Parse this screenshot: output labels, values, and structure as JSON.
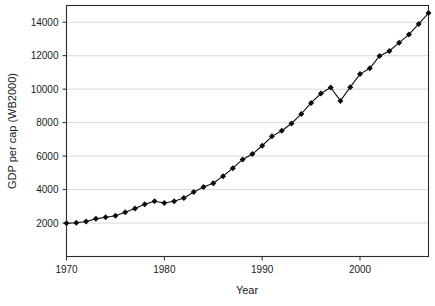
{
  "chart_data": {
    "type": "line",
    "title": "",
    "xlabel": "Year",
    "ylabel": "GDP per cap (WB2000)",
    "xlim": [
      1970,
      2007
    ],
    "ylim": [
      0,
      15000
    ],
    "xticks": [
      1970,
      1980,
      1990,
      2000
    ],
    "xtick_labels": [
      "1970",
      "1980",
      "1990",
      "2000"
    ],
    "yticks": [
      2000,
      4000,
      6000,
      8000,
      10000,
      12000,
      14000
    ],
    "ytick_labels": [
      "2000",
      "4000",
      "6000",
      "8000",
      "10000",
      "12000",
      "14000"
    ],
    "grid": "horizontal",
    "legend": "none",
    "marker": "filled-diamond",
    "x": [
      1970,
      1971,
      1972,
      1973,
      1974,
      1975,
      1976,
      1977,
      1978,
      1979,
      1980,
      1981,
      1982,
      1983,
      1984,
      1985,
      1986,
      1987,
      1988,
      1989,
      1990,
      1991,
      1992,
      1993,
      1994,
      1995,
      1996,
      1997,
      1998,
      1999,
      2000,
      2001,
      2002,
      2003,
      2004,
      2005,
      2006,
      2007
    ],
    "values": [
      1980,
      2020,
      2090,
      2250,
      2350,
      2440,
      2650,
      2870,
      3120,
      3300,
      3200,
      3300,
      3500,
      3850,
      4150,
      4380,
      4800,
      5280,
      5800,
      6120,
      6620,
      7180,
      7520,
      7950,
      8520,
      9180,
      9740,
      10100,
      9300,
      10120,
      10900,
      11250,
      11980,
      12280,
      12780,
      13260,
      13900,
      14550
    ],
    "series_name": "GDP per cap"
  },
  "axes": {
    "x_axis_title": "Year",
    "y_axis_title": "GDP per cap (WB2000)"
  }
}
